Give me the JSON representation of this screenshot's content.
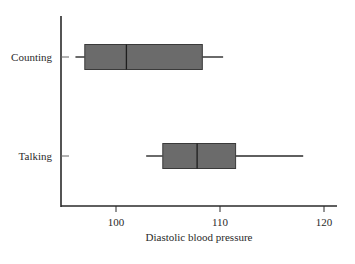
{
  "chart_data": {
    "type": "boxplot",
    "orientation": "horizontal",
    "title": "",
    "xlabel": "Diastolic blood pressure",
    "ylabel": "",
    "xlim": [
      94.5,
      121.3
    ],
    "xticks": [
      100,
      110,
      120
    ],
    "xtick_labels": [
      "100",
      "110",
      "120"
    ],
    "grid": false,
    "legend": null,
    "categories": [
      "Counting",
      "Talking"
    ],
    "series": [
      {
        "name": "Counting",
        "min": 96.1,
        "q1": 97.0,
        "median": 101.0,
        "q3": 108.3,
        "max": 110.3
      },
      {
        "name": "Talking",
        "min": 102.9,
        "q1": 104.5,
        "median": 107.8,
        "q3": 111.5,
        "max": 118.0
      }
    ],
    "colors": {
      "box_fill": "#6b6b6b",
      "box_stroke": "#3a3a3a",
      "axis": "#2a2a2a",
      "whisker": "#2a2a2a"
    }
  }
}
